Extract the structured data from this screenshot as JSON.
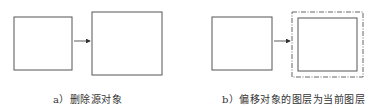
{
  "panels": [
    {
      "id": "a",
      "caption": "a）删除源对象",
      "source_box": {
        "x": 14,
        "y": 17,
        "w": 58,
        "h": 53
      },
      "arrow": {
        "x1": 74,
        "x2": 91,
        "y": 41
      },
      "result_box": {
        "x": 92,
        "y": 12,
        "w": 70,
        "h": 63
      },
      "result_outline": "none"
    },
    {
      "id": "b",
      "caption": "b）偏移对象的图层为当前图层",
      "source_box": {
        "x": 212,
        "y": 17,
        "w": 60,
        "h": 53
      },
      "arrow": {
        "x1": 274,
        "x2": 291,
        "y": 41
      },
      "result_box": {
        "x": 298,
        "y": 18,
        "w": 59,
        "h": 53
      },
      "result_outline": "dash-dot",
      "offset_box": {
        "x": 292,
        "y": 12,
        "w": 71,
        "h": 65
      }
    }
  ],
  "colors": {
    "stroke": "#555555",
    "dashed_stroke": "#666666",
    "text": "#333333"
  }
}
